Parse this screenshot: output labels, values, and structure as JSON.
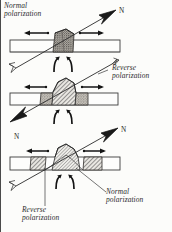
{
  "figure": {
    "background": "#fcfcfa",
    "ink": "#2b2b2b"
  },
  "labels": {
    "normal_top": "Normal\npolarization",
    "reverse_right": "Reverse\npolarization",
    "normal_bottom": "Normal\npolarization",
    "reverse_bottom": "Reverse\npolarization",
    "north_top": "N",
    "north_left": "N",
    "north_right": "N"
  },
  "panels": [
    {
      "name": "stage-1",
      "slab": {
        "x": 10,
        "y": 40,
        "width": 110,
        "height": 12
      },
      "blocks": [
        {
          "name": "central-normal-block",
          "fill": "stipple-dark",
          "x": 52,
          "y": 30,
          "width": 22,
          "height": 22
        }
      ],
      "spread_arrows": [
        "left",
        "right"
      ],
      "upwelling_arrows": 2,
      "polarization_arrow": {
        "direction": "up-right",
        "north": "N",
        "type": "normal"
      }
    },
    {
      "name": "stage-2",
      "slab": {
        "x": 10,
        "y": 93,
        "width": 108,
        "height": 12
      },
      "blocks": [
        {
          "name": "central-reverse-block",
          "fill": "hatch",
          "x": 50,
          "y": 78,
          "width": 28,
          "height": 27
        },
        {
          "name": "left-normal-block",
          "fill": "stipple-dark",
          "x": 40,
          "y": 93,
          "width": 12,
          "height": 12
        },
        {
          "name": "right-normal-block",
          "fill": "stipple-dark",
          "x": 76,
          "y": 93,
          "width": 12,
          "height": 12
        }
      ],
      "spread_arrows": [
        "left",
        "right"
      ],
      "upwelling_arrows": 2,
      "polarization_arrow": {
        "direction": "down-left",
        "north": "",
        "type": "reverse"
      }
    },
    {
      "name": "stage-3",
      "slab": {
        "x": 10,
        "y": 157,
        "width": 110,
        "height": 13
      },
      "blocks": [
        {
          "name": "central-normal-block",
          "fill": "hatch-fine",
          "x": 54,
          "y": 144,
          "width": 24,
          "height": 26
        },
        {
          "name": "left-reverse-block",
          "fill": "hatch",
          "x": 30,
          "y": 157,
          "width": 16,
          "height": 13
        },
        {
          "name": "right-reverse-block",
          "fill": "hatch",
          "x": 84,
          "y": 157,
          "width": 18,
          "height": 13
        }
      ],
      "spread_arrows": [
        "left",
        "right"
      ],
      "upwelling_arrows": 2,
      "polarization_arrow": {
        "direction": "up-right",
        "north": "N",
        "type": "normal"
      }
    }
  ]
}
